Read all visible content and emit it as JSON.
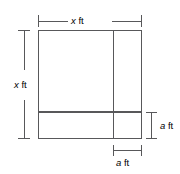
{
  "figure": {
    "kind": "geometry-diagram",
    "shape": "square-with-cut-border",
    "dimensions": {
      "top": {
        "variable": "x",
        "unit": "ft"
      },
      "left": {
        "variable": "x",
        "unit": "ft"
      },
      "right": {
        "variable": "a",
        "unit": "ft"
      },
      "bottom": {
        "variable": "a",
        "unit": "ft"
      }
    },
    "colors": {
      "line": "#58585a",
      "shaded_fill": "#e2e2e2",
      "background": "#ffffff",
      "text": "#000000"
    }
  }
}
